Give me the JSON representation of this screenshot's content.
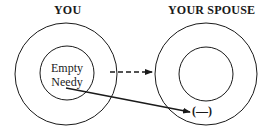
{
  "diagram": {
    "left": {
      "title": "YOU",
      "inner_lines": [
        "Empty",
        "Needy"
      ]
    },
    "right": {
      "title": "YOUR SPOUSE",
      "marker": "(—)"
    },
    "arrows": [
      {
        "from": "you-outer-circle",
        "to": "spouse-outer-circle",
        "style": "dashed"
      },
      {
        "from": "you-inner-text",
        "to": "spouse-marker",
        "style": "solid"
      }
    ],
    "colors": {
      "stroke": "#1a1a1a",
      "background": "#ffffff"
    }
  }
}
